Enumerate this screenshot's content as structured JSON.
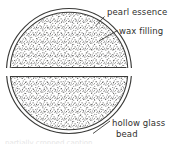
{
  "figure": {
    "title_visible": false,
    "background_color": "#ffffff",
    "line_color": "#3a3a38",
    "stipple_color": "#5a5a58",
    "text_color": "#30302e",
    "circle": {
      "center_x": 69,
      "center_y": 71,
      "outer_radius": 63,
      "inner_radius": 59,
      "shell_description": "double outline representing hollow glass wall"
    },
    "split": {
      "orientation": "horizontal",
      "gap_top_y": 68,
      "gap_bottom_y": 76,
      "description": "horizontal cut separating upper and lower halves"
    },
    "fill_pattern": "stipple"
  },
  "labels": [
    {
      "id": "pearl-essence",
      "text": "pearl essence",
      "target": "outer glass shell surface",
      "leader": {
        "from_x": 104,
        "from_y": 17,
        "to_x": 97,
        "to_y": 24
      }
    },
    {
      "id": "wax-filling",
      "text": "wax filling",
      "target": "stippled interior of upper half",
      "leader": {
        "from_x": 117,
        "from_y": 31,
        "to_x": 100,
        "to_y": 40
      }
    },
    {
      "id": "hollow-glass-bead",
      "line1": "hollow glass",
      "line2": "bead",
      "target": "lower glass wall",
      "leader": {
        "from_x": 110,
        "from_y": 122,
        "to_x": 95,
        "to_y": 133
      }
    }
  ],
  "caption_artifact": {
    "text": "partially cropped caption",
    "legible": false
  }
}
